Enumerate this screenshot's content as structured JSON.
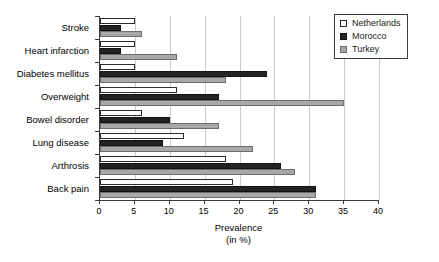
{
  "chart_data": {
    "type": "bar",
    "orientation": "horizontal",
    "title": "",
    "xlabel": "Prevalence",
    "xlabel_line2": "(in %)",
    "ylabel": "",
    "xlim": [
      0,
      40
    ],
    "xticks": [
      0,
      5,
      10,
      15,
      20,
      25,
      30,
      35,
      40
    ],
    "xticklabels": [
      "0",
      "5",
      "10",
      "15",
      "20",
      "25",
      "30",
      "35",
      "40"
    ],
    "grid": true,
    "grid_axis": "x",
    "legend_position": "top-right",
    "categories": [
      "Stroke",
      "Heart infarction",
      "Diabetes mellitus",
      "Overweight",
      "Bowel disorder",
      "Lung disease",
      "Arthrosis",
      "Back pain"
    ],
    "series": [
      {
        "name": "Netherlands",
        "color": "#ffffff",
        "edge_color": "#2b2b2b",
        "values": [
          5,
          5,
          5,
          11,
          6,
          12,
          18,
          19
        ]
      },
      {
        "name": "Morocco",
        "color": "#232323",
        "edge_color": "#121212",
        "values": [
          3,
          3,
          24,
          17,
          10,
          9,
          26,
          31
        ]
      },
      {
        "name": "Turkey",
        "color": "#a8a8a8",
        "edge_color": "#6d6d6d",
        "values": [
          6,
          11,
          18,
          35,
          17,
          22,
          28,
          31
        ]
      }
    ]
  },
  "legend": {
    "items": [
      {
        "label": "Netherlands",
        "swatch": "nl"
      },
      {
        "label": "Morocco",
        "swatch": "ma"
      },
      {
        "label": "Turkey",
        "swatch": "tr"
      }
    ]
  }
}
